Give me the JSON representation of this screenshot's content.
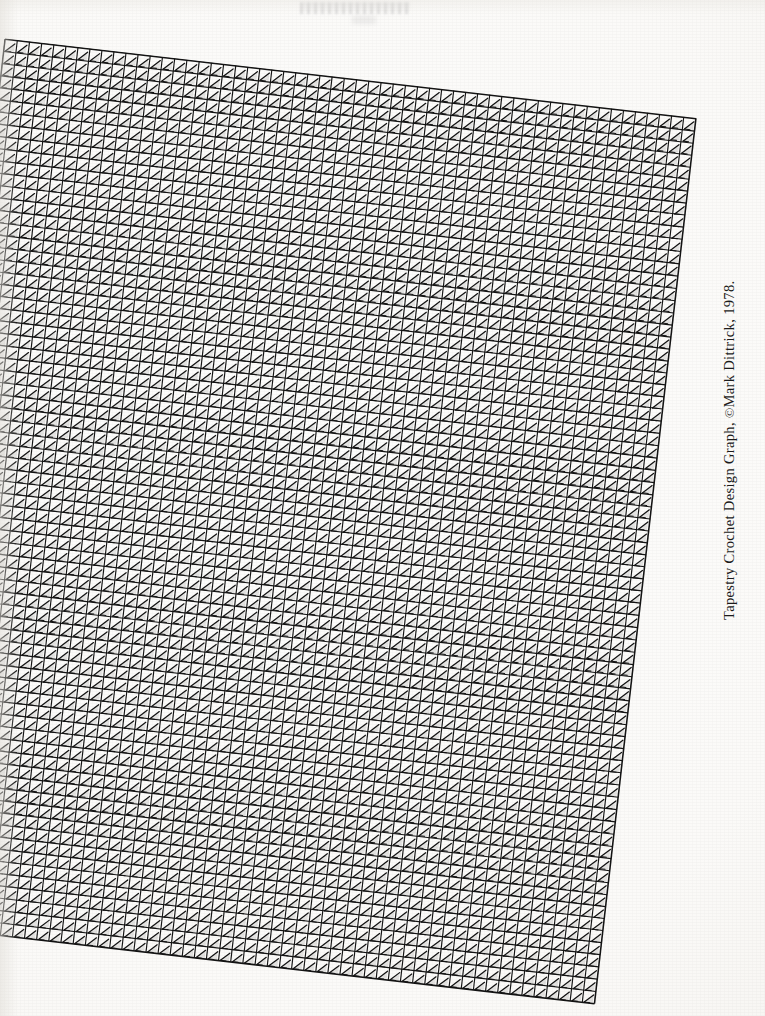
{
  "page": {
    "kind": "book-page-scan",
    "background_color": "#fcfbf9",
    "ink_color": "#141414",
    "width": 765,
    "height": 1016
  },
  "caption": {
    "prefix": "Tapestry Crochet Design Graph, ",
    "copyright_symbol": "©",
    "credit": "Mark Dittrick, 1978.",
    "full_text": "Tapestry Crochet Design Graph, ©Mark Dittrick, 1978.",
    "orientation": "rotated-90-ccw",
    "color": "#1b1b1b"
  },
  "artifacts": {
    "top_smudge_label": "faint scan show-through smudge"
  },
  "chart_data": {
    "type": "table",
    "title": "Tapestry Crochet Design Graph",
    "subtitle": "©Mark Dittrick, 1978.",
    "columns": 57,
    "rows": 73,
    "cell_width_px": 12.2,
    "cell_height_px": 12.2,
    "cell_symbol": "diagonal-stitch-stroke",
    "grid": true,
    "grid_line_color": "#141414",
    "grid_rotation_deg": 6.55,
    "values": [],
    "xlabel": "",
    "ylabel": "",
    "legend": []
  }
}
